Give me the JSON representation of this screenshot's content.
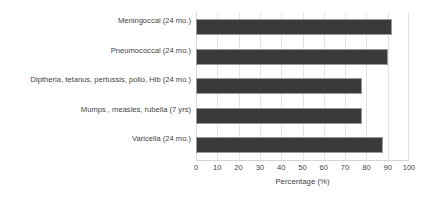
{
  "chart_data": {
    "type": "bar",
    "orientation": "horizontal",
    "title": "",
    "xlabel": "Percentage (%)",
    "ylabel": "",
    "xlim": [
      0,
      100
    ],
    "xticks": [
      "0",
      "10",
      "20",
      "30",
      "40",
      "50",
      "60",
      "70",
      "80",
      "90",
      "100"
    ],
    "grid": true,
    "legend": false,
    "categories": [
      "Meningoccal (24 mo.)",
      "Pneumococcal (24 mo.)",
      "Diptheria, tetanus, pertussis, polio, Hib (24 mo.)",
      "Mumps , measles, rubella (7 yrs)",
      "Varicella (24 mo.)"
    ],
    "values": [
      92,
      90,
      78,
      78,
      88
    ],
    "bar_color": "#3a3a3a",
    "bar_edge_color": "#9a9a9a",
    "gridline_color": "#e4e4e4",
    "background_color": "#ffffff"
  }
}
